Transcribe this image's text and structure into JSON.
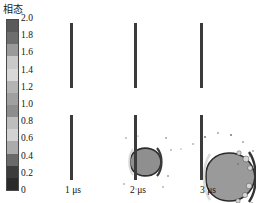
{
  "legend": {
    "title": "相态",
    "title_icon": "colorbar-legend",
    "orientation": "vertical",
    "ticks": [
      "2.0",
      "1.8",
      "1.6",
      "1.4",
      "1.2",
      "1.0",
      "0.8",
      "0.6",
      "0.4",
      "0.2",
      "0"
    ],
    "range": [
      0,
      2.0
    ],
    "colormap": "grayscale-discrete",
    "bands": [
      "#5a5a5a",
      "#6e6e6e",
      "#9a9a9a",
      "#c9c9c9",
      "#d8d8d8",
      "#b4b4b4",
      "#a0a0a0",
      "#8d8d8d",
      "#bdbdbd",
      "#d2d2d2",
      "#ababab",
      "#6a6a6a",
      "#3c3c3c",
      "#2a2a2a"
    ]
  },
  "chart_data": {
    "type": "heatmap",
    "title": "",
    "xlabel": "",
    "ylabel": "",
    "colorbar_label": "相态",
    "colorbar_range": [
      0,
      2.0
    ],
    "colorbar_ticks": [
      2.0,
      1.8,
      1.6,
      1.4,
      1.2,
      1.0,
      0.8,
      0.6,
      0.4,
      0.2,
      0
    ],
    "grid": false,
    "legend_position": "left",
    "panels": [
      {
        "label": "1 μs",
        "time_us": 1,
        "barrier_x": 22,
        "jet_center_x": 38,
        "jet_radius_x": 15,
        "jet_radius_y": 17,
        "spray_density": "low",
        "core_phase_value": 1.2,
        "rim_phase_value": 0.2
      },
      {
        "label": "2 μs",
        "time_us": 2,
        "barrier_x": 86,
        "jet_center_x": 107,
        "jet_radius_x": 25,
        "jet_radius_y": 30,
        "spray_density": "medium",
        "core_phase_value": 1.2,
        "rim_phase_value": 0.2
      },
      {
        "label": "3 μs",
        "time_us": 3,
        "barrier_x": 152,
        "jet_center_x": 180,
        "jet_radius_x": 33,
        "jet_radius_y": 42,
        "spray_density": "high",
        "core_phase_value": 1.2,
        "rim_phase_value": 0.2
      }
    ]
  }
}
